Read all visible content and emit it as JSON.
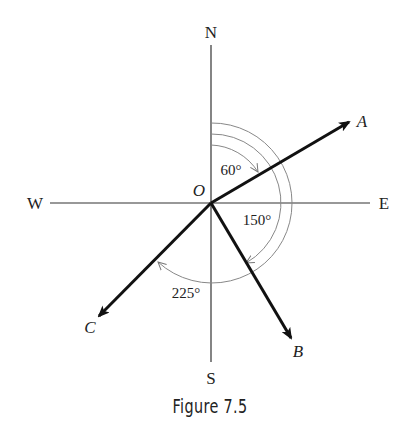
{
  "figure": {
    "caption": "Figure 7.5",
    "origin_label": "O",
    "compass": {
      "north": "N",
      "south": "S",
      "east": "E",
      "west": "W"
    },
    "vectors": [
      {
        "label": "A",
        "bearing_deg": 60
      },
      {
        "label": "B",
        "bearing_deg": 150
      },
      {
        "label": "C",
        "bearing_deg": 225
      }
    ],
    "angle_labels": {
      "a": "60°",
      "b": "150°",
      "c": "225°"
    },
    "colors": {
      "vector": "#111111",
      "axis": "#333333",
      "arc": "#888888"
    }
  }
}
